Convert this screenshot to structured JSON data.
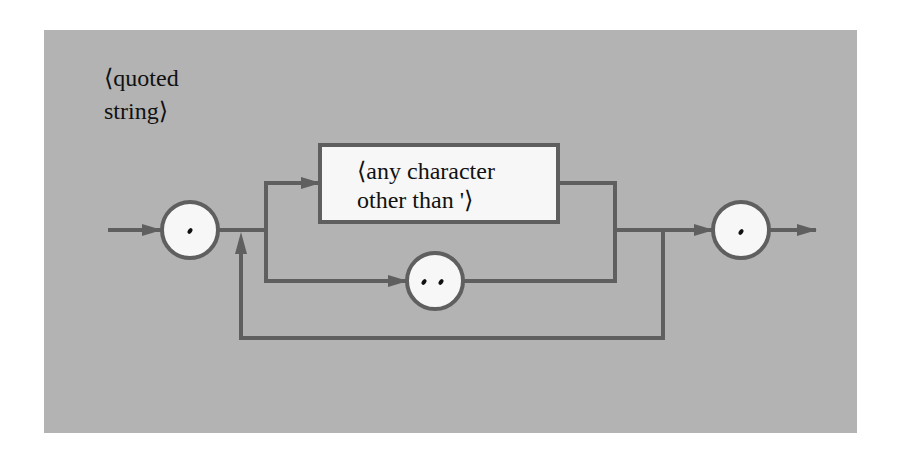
{
  "diagram": {
    "type": "syntax-diagram",
    "title_line1": "⟨quoted",
    "title_line2": "string⟩",
    "nodes": [
      {
        "id": "open-quote",
        "shape": "circle",
        "label": "'"
      },
      {
        "id": "any-char",
        "shape": "rectangle",
        "label_line1": "⟨any character",
        "label_line2": "other than '⟩"
      },
      {
        "id": "double-quote",
        "shape": "circle",
        "label": "''"
      },
      {
        "id": "close-quote",
        "shape": "circle",
        "label": "'"
      }
    ],
    "edges": [
      {
        "from": "entry",
        "to": "open-quote"
      },
      {
        "from": "open-quote",
        "to": "any-char"
      },
      {
        "from": "open-quote",
        "to": "double-quote"
      },
      {
        "from": "any-char",
        "to": "close-quote"
      },
      {
        "from": "double-quote",
        "to": "close-quote"
      },
      {
        "from": "merge",
        "to": "open-quote-exit",
        "kind": "loop-back"
      },
      {
        "from": "close-quote",
        "to": "exit"
      }
    ],
    "colors": {
      "panel": "#b3b3b3",
      "line": "#5f5f5f",
      "node_fill": "#f7f7f7",
      "text": "#111111"
    }
  }
}
